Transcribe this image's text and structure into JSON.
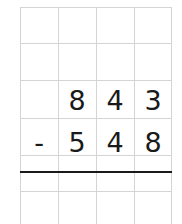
{
  "problem": {
    "operator": "-",
    "minuend_digits": [
      "8",
      "4",
      "3"
    ],
    "subtrahend_digits": [
      "5",
      "4",
      "8"
    ],
    "result_digits": [
      "",
      "",
      ""
    ]
  },
  "grid": {
    "columns": 4,
    "line_color": "#d4d4d4",
    "rule_color": "#1a1a1a"
  }
}
